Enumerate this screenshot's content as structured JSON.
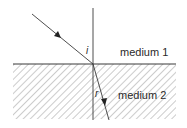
{
  "diagram": {
    "title": "",
    "type": "refraction",
    "labels": {
      "incident_angle": "i",
      "refracted_angle": "r",
      "medium_top": "medium 1",
      "medium_bottom": "medium 2"
    },
    "colors": {
      "line": "#3a3a3a",
      "hatch": "#9a9a9a",
      "background": "#ffffff"
    }
  }
}
